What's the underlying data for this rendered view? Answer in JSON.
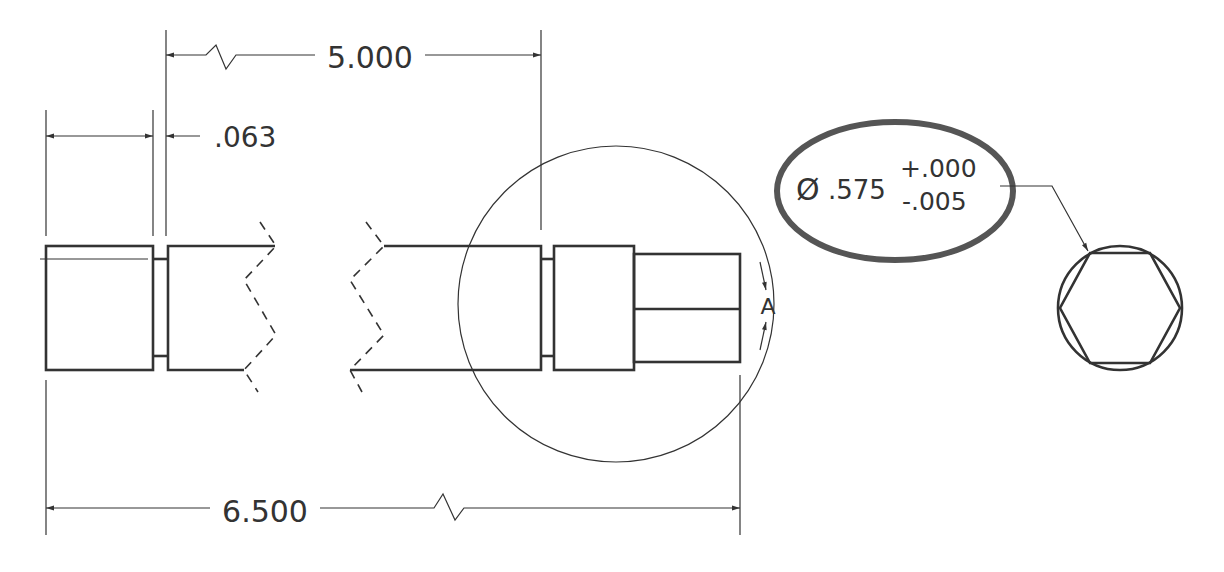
{
  "drawing": {
    "dimensions": {
      "overall_length": "6.500",
      "shoulder_to_groove": "5.000",
      "groove_width": ".063"
    },
    "tolerance_callout": {
      "diameter_symbol": "Ø",
      "nominal": ".575",
      "upper": "+.000",
      "lower": "-.005"
    },
    "section_label": "A",
    "highlight_color": "#555555",
    "line_color": "#333333"
  }
}
